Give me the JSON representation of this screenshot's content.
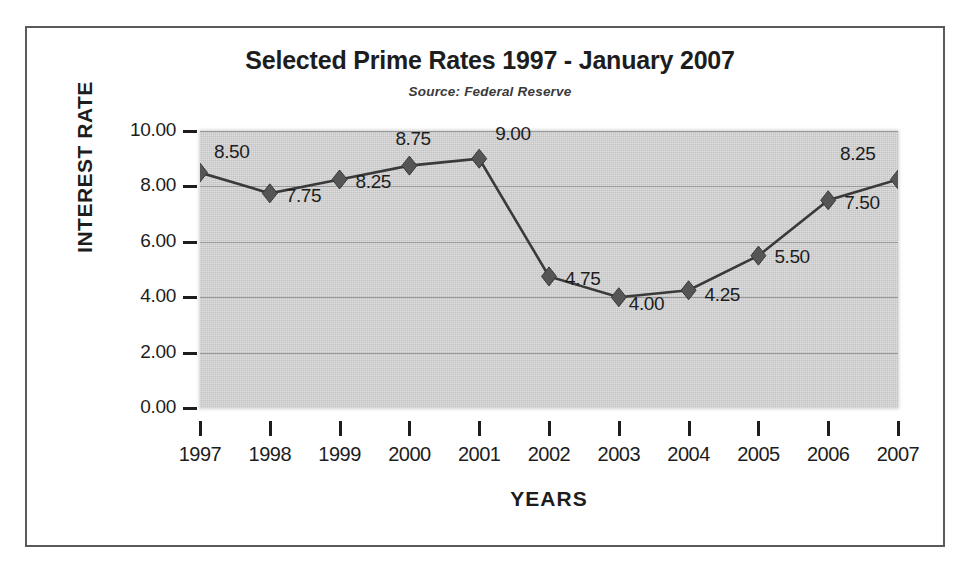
{
  "chart_data": {
    "type": "line",
    "title": "Selected Prime Rates 1997 - January 2007",
    "subtitle": "Source:  Federal Reserve",
    "xlabel": "YEARS",
    "ylabel": "INTEREST RATE",
    "categories": [
      "1997",
      "1998",
      "1999",
      "2000",
      "2001",
      "2002",
      "2003",
      "2004",
      "2005",
      "2006",
      "2007"
    ],
    "values": [
      8.5,
      7.75,
      8.25,
      8.75,
      9.0,
      4.75,
      4.0,
      4.25,
      5.5,
      7.5,
      8.25
    ],
    "point_labels": [
      "8.50",
      "7.75",
      "8.25",
      "8.75",
      "9.00",
      "4.75",
      "4.00",
      "4.25",
      "5.50",
      "7.50",
      "8.25"
    ],
    "ylim": [
      0,
      10
    ],
    "ytick_labels": [
      "10.00",
      "8.00",
      "6.00",
      "4.00",
      "2.00",
      "0.00"
    ],
    "ytick_values": [
      10,
      8,
      6,
      4,
      2,
      0
    ],
    "grid": true,
    "legend": "none",
    "series_name": "Prime Rate",
    "marker": "diamond",
    "colors": {
      "line": "#3a3a3a",
      "marker": "#555555",
      "plot_background": "#c9c9c9",
      "gridline": "#9a9a9a",
      "text": "#1d1d1d",
      "frame_border": "#5a5a5a",
      "figure_background": "#ffffff"
    }
  }
}
